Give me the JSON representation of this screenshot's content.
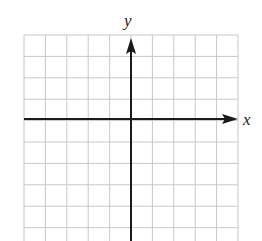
{
  "diagram": {
    "type": "coordinate-grid",
    "axes": {
      "x_label": "x",
      "y_label": "y"
    },
    "grid": {
      "columns": 10,
      "rows_visible": 10,
      "cell_size_px": 21.4,
      "origin_column": 5,
      "origin_row": 4
    },
    "colors": {
      "grid_line": "#c8c8c8",
      "axis": "#1a1a1a",
      "background": "#ffffff"
    }
  }
}
